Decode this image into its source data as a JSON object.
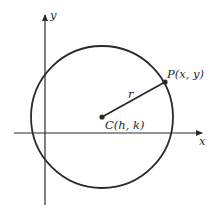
{
  "diagram": {
    "type": "circle-on-coordinate-plane",
    "colors": {
      "stroke": "#2a2a2a",
      "background": "#ffffff"
    },
    "axes": {
      "x_label": "x",
      "y_label": "y"
    },
    "circle": {
      "center_label": "C(h, k)",
      "point_label": "P(x, y)",
      "radius_label": "r"
    }
  }
}
